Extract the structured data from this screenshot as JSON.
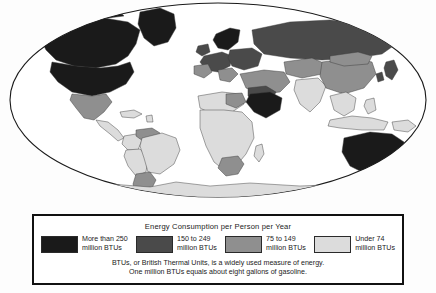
{
  "legend": {
    "title": "Energy Consumption per Person per Year",
    "entries": [
      {
        "label_line1": "More than 250",
        "label_line2": "million BTUs",
        "color": "#1a1a1a",
        "swatch_name": "swatch-more-than-250"
      },
      {
        "label_line1": "150 to 249",
        "label_line2": "million BTUs",
        "color": "#4a4a4a",
        "swatch_name": "swatch-150-to-249"
      },
      {
        "label_line1": "75 to 149",
        "label_line2": "million BTUs",
        "color": "#8f8f8f",
        "swatch_name": "swatch-75-to-149"
      },
      {
        "label_line1": "Under 74",
        "label_line2": "million BTUs",
        "color": "#dcdcdc",
        "swatch_name": "swatch-under-74"
      }
    ],
    "note_line1": "BTUs, or British Thermal Units, is a widely used measure of energy.",
    "note_line2": "One million BTUs equals about eight gallons of gasoline."
  },
  "map": {
    "projection": "elliptical-world",
    "ocean_color": "#ffffff",
    "outline_color": "#1a1a1a",
    "border_color": "#3a3a3a",
    "regions": [
      {
        "name": "canada",
        "category": "More than 250",
        "color": "#1a1a1a"
      },
      {
        "name": "alaska",
        "category": "More than 250",
        "color": "#1a1a1a"
      },
      {
        "name": "greenland",
        "category": "More than 250",
        "color": "#1a1a1a"
      },
      {
        "name": "united-states",
        "category": "More than 250",
        "color": "#1a1a1a"
      },
      {
        "name": "mexico",
        "category": "75 to 149",
        "color": "#8f8f8f"
      },
      {
        "name": "central-america",
        "category": "Under 74",
        "color": "#dcdcdc"
      },
      {
        "name": "caribbean",
        "category": "Under 74",
        "color": "#dcdcdc"
      },
      {
        "name": "venezuela",
        "category": "75 to 149",
        "color": "#8f8f8f"
      },
      {
        "name": "colombia",
        "category": "Under 74",
        "color": "#dcdcdc"
      },
      {
        "name": "brazil",
        "category": "Under 74",
        "color": "#dcdcdc"
      },
      {
        "name": "peru-bolivia",
        "category": "Under 74",
        "color": "#dcdcdc"
      },
      {
        "name": "argentina-chile",
        "category": "75 to 149",
        "color": "#8f8f8f"
      },
      {
        "name": "north-africa",
        "category": "Under 74",
        "color": "#dcdcdc"
      },
      {
        "name": "libya",
        "category": "75 to 149",
        "color": "#8f8f8f"
      },
      {
        "name": "sub-saharan-africa",
        "category": "Under 74",
        "color": "#dcdcdc"
      },
      {
        "name": "south-africa",
        "category": "75 to 149",
        "color": "#8f8f8f"
      },
      {
        "name": "western-europe",
        "category": "150 to 249",
        "color": "#4a4a4a"
      },
      {
        "name": "scandinavia",
        "category": "More than 250",
        "color": "#1a1a1a"
      },
      {
        "name": "eastern-europe",
        "category": "150 to 249",
        "color": "#4a4a4a"
      },
      {
        "name": "russia",
        "category": "150 to 249",
        "color": "#4a4a4a"
      },
      {
        "name": "saudi-arabia",
        "category": "More than 250",
        "color": "#1a1a1a"
      },
      {
        "name": "middle-east",
        "category": "150 to 249",
        "color": "#4a4a4a"
      },
      {
        "name": "turkey-iran",
        "category": "75 to 149",
        "color": "#8f8f8f"
      },
      {
        "name": "india",
        "category": "Under 74",
        "color": "#dcdcdc"
      },
      {
        "name": "china",
        "category": "75 to 149",
        "color": "#8f8f8f"
      },
      {
        "name": "mongolia",
        "category": "75 to 149",
        "color": "#8f8f8f"
      },
      {
        "name": "japan",
        "category": "150 to 249",
        "color": "#4a4a4a"
      },
      {
        "name": "korea",
        "category": "150 to 249",
        "color": "#4a4a4a"
      },
      {
        "name": "southeast-asia",
        "category": "Under 74",
        "color": "#dcdcdc"
      },
      {
        "name": "indonesia",
        "category": "Under 74",
        "color": "#dcdcdc"
      },
      {
        "name": "papua-new-guinea",
        "category": "Under 74",
        "color": "#dcdcdc"
      },
      {
        "name": "australia",
        "category": "More than 250",
        "color": "#1a1a1a"
      },
      {
        "name": "new-zealand",
        "category": "More than 250",
        "color": "#1a1a1a"
      },
      {
        "name": "antarctica",
        "category": "Under 74",
        "color": "#dcdcdc"
      }
    ]
  }
}
